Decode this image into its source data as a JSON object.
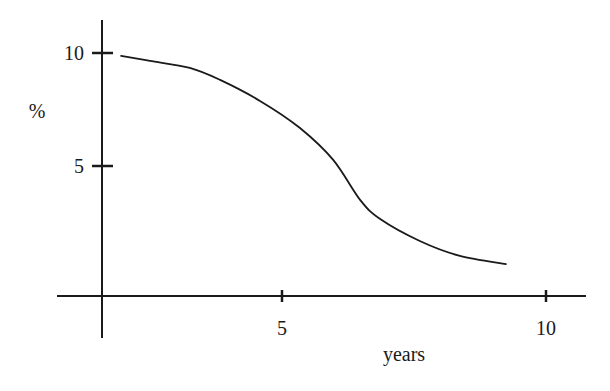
{
  "chart_data": {
    "type": "line",
    "title": "",
    "xlabel": "years",
    "ylabel": "%",
    "xlim": [
      0,
      10.7
    ],
    "ylim": [
      0,
      11
    ],
    "grid": false,
    "legend": null,
    "x_ticks": [
      {
        "value": 5,
        "label": "5",
        "px": 282
      },
      {
        "value": 10,
        "label": "10",
        "px": 546
      }
    ],
    "y_ticks": [
      {
        "value": 5,
        "label": "5",
        "py": 166
      },
      {
        "value": 10,
        "label": "10",
        "py": 53
      }
    ],
    "series": [
      {
        "name": "curve",
        "x": [
          0.53,
          1.33,
          2.44,
          3.28,
          4.39,
          5.34,
          5.97,
          6.48,
          6.86,
          7.61,
          8.37,
          9.24
        ],
        "y": [
          9.87,
          9.65,
          9.34,
          8.81,
          7.88,
          6.68,
          5.27,
          3.5,
          2.65,
          1.68,
          1.02,
          0.66
        ]
      }
    ]
  },
  "colors": {
    "ink": "#1a1a1a",
    "background": "#ffffff"
  }
}
